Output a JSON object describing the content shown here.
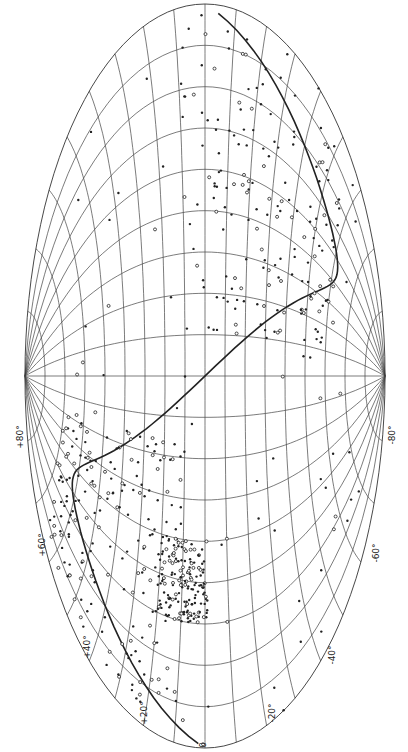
{
  "map": {
    "projection": "aitoff-rotated",
    "center": [
      205,
      376
    ],
    "semi_axis_x": 180,
    "semi_axis_y": 372,
    "colors": {
      "ink": "#222222",
      "grid": "#444444",
      "background": "#ffffff"
    },
    "latitude_labels": [
      {
        "text": "+80°",
        "x": 8,
        "y": 432
      },
      {
        "text": "+60°",
        "x": 30,
        "y": 540
      },
      {
        "text": "+40°",
        "x": 75,
        "y": 642
      },
      {
        "text": "+20°",
        "x": 132,
        "y": 708
      },
      {
        "text": "0",
        "x": 200,
        "y": 740
      },
      {
        "text": "-20°",
        "x": 262,
        "y": 708
      },
      {
        "text": "-40°",
        "x": 322,
        "y": 650
      },
      {
        "text": "-60°",
        "x": 366,
        "y": 548
      },
      {
        "text": "-80°",
        "x": 382,
        "y": 430
      }
    ],
    "center_label": {
      "text": "+",
      "x": 205,
      "y": 350
    }
  }
}
